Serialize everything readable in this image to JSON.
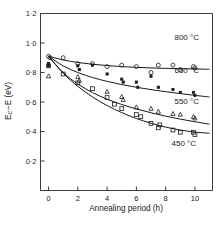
{
  "chart_data": {
    "type": "scatter",
    "title": "",
    "subtitle": "",
    "xlabel": "Annealing period (h)",
    "ylabel": "E_C − E (eV)",
    "ylabel_parts": {
      "main": "E",
      "sub": "C",
      "rest": "−E (eV)"
    },
    "xlim": [
      -0.55,
      11.2
    ],
    "ylim": [
      0.0,
      1.2
    ],
    "xticks": [
      0,
      2,
      4,
      6,
      8,
      10
    ],
    "xtick_labels": [
      "0",
      "2",
      "4",
      "6",
      "8",
      "10"
    ],
    "yticks": [
      0.2,
      0.4,
      0.6,
      0.8,
      1.0,
      1.2
    ],
    "ytick_labels": [
      "0·2",
      "0·4",
      "0·6",
      "0·8",
      "1·0",
      "1·2"
    ],
    "grid": false,
    "legend_position": "inline-right-of-curves",
    "series": [
      {
        "name": "800 °C",
        "label": "800 °C",
        "marker": "open-circle",
        "color": "#1a1a1a",
        "points": [
          [
            0.0,
            0.91
          ],
          [
            0.1,
            0.9
          ],
          [
            1.0,
            0.9
          ],
          [
            2.0,
            0.86
          ],
          [
            3.0,
            0.86
          ],
          [
            4.0,
            0.84
          ],
          [
            5.0,
            0.85
          ],
          [
            6.0,
            0.84
          ],
          [
            7.0,
            0.8
          ],
          [
            7.5,
            0.85
          ],
          [
            8.5,
            0.85
          ],
          [
            9.0,
            0.82
          ],
          [
            9.9,
            0.84
          ],
          [
            10.0,
            0.83
          ]
        ],
        "fit": [
          [
            0.0,
            0.91
          ],
          [
            1.0,
            0.885
          ],
          [
            2.0,
            0.868
          ],
          [
            3.0,
            0.856
          ],
          [
            4.0,
            0.847
          ],
          [
            5.0,
            0.84
          ],
          [
            6.0,
            0.835
          ],
          [
            7.0,
            0.831
          ],
          [
            8.0,
            0.828
          ],
          [
            9.0,
            0.826
          ],
          [
            10.0,
            0.824
          ],
          [
            11.0,
            0.822
          ]
        ],
        "label_x": 8.6,
        "label_y": 1.02
      },
      {
        "name": "650 °C",
        "label": "650 °C",
        "marker": "small-filled-square",
        "color": "#1a1a1a",
        "points": [
          [
            0.0,
            0.845
          ],
          [
            0.0,
            0.86
          ],
          [
            2.0,
            0.845
          ],
          [
            2.1,
            0.82
          ],
          [
            3.0,
            0.85
          ],
          [
            4.0,
            0.79
          ],
          [
            5.0,
            0.755
          ],
          [
            5.1,
            0.735
          ],
          [
            6.0,
            0.735
          ],
          [
            6.1,
            0.7
          ],
          [
            7.0,
            0.775
          ],
          [
            7.5,
            0.7
          ],
          [
            8.5,
            0.685
          ],
          [
            9.0,
            0.665
          ],
          [
            9.9,
            0.665
          ],
          [
            10.0,
            0.645
          ]
        ],
        "fit": [
          [
            0.0,
            0.91
          ],
          [
            1.0,
            0.845
          ],
          [
            2.0,
            0.8
          ],
          [
            3.0,
            0.766
          ],
          [
            4.0,
            0.74
          ],
          [
            5.0,
            0.718
          ],
          [
            6.0,
            0.7
          ],
          [
            7.0,
            0.684
          ],
          [
            8.0,
            0.67
          ],
          [
            9.0,
            0.657
          ],
          [
            10.0,
            0.645
          ],
          [
            11.0,
            0.634
          ]
        ],
        "label_x": 8.6,
        "label_y": 0.8
      },
      {
        "name": "550 °C",
        "label": "550 °C",
        "marker": "triangle",
        "color": "#1a1a1a",
        "points": [
          [
            0.0,
            0.775
          ],
          [
            2.0,
            0.77
          ],
          [
            2.1,
            0.745
          ],
          [
            4.0,
            0.67
          ],
          [
            5.0,
            0.635
          ],
          [
            5.1,
            0.615
          ],
          [
            6.0,
            0.565
          ],
          [
            7.0,
            0.555
          ],
          [
            7.5,
            0.535
          ],
          [
            8.5,
            0.52
          ],
          [
            9.0,
            0.515
          ],
          [
            9.9,
            0.5
          ],
          [
            10.0,
            0.49
          ]
        ],
        "fit": [
          [
            0.0,
            0.91
          ],
          [
            1.0,
            0.8
          ],
          [
            2.0,
            0.722
          ],
          [
            3.0,
            0.664
          ],
          [
            4.0,
            0.619
          ],
          [
            5.0,
            0.583
          ],
          [
            6.0,
            0.553
          ],
          [
            7.0,
            0.527
          ],
          [
            8.0,
            0.504
          ],
          [
            9.0,
            0.484
          ],
          [
            10.0,
            0.466
          ],
          [
            11.0,
            0.45
          ]
        ],
        "label_x": 8.6,
        "label_y": 0.585
      },
      {
        "name": "450 °C",
        "label": "450 °C",
        "marker": "open-square",
        "color": "#1a1a1a",
        "points": [
          [
            0.0,
            0.845
          ],
          [
            1.0,
            0.79
          ],
          [
            2.0,
            0.73
          ],
          [
            3.0,
            0.69
          ],
          [
            4.0,
            0.63
          ],
          [
            4.5,
            0.585
          ],
          [
            5.0,
            0.555
          ],
          [
            6.0,
            0.515
          ],
          [
            6.3,
            0.5
          ],
          [
            7.0,
            0.455
          ],
          [
            7.5,
            0.425
          ],
          [
            7.6,
            0.445
          ],
          [
            8.5,
            0.41
          ],
          [
            9.0,
            0.395
          ],
          [
            9.9,
            0.395
          ],
          [
            10.0,
            0.38
          ]
        ],
        "fit": [
          [
            0.0,
            0.91
          ],
          [
            1.0,
            0.795
          ],
          [
            2.0,
            0.706
          ],
          [
            3.0,
            0.634
          ],
          [
            4.0,
            0.576
          ],
          [
            5.0,
            0.528
          ],
          [
            6.0,
            0.488
          ],
          [
            7.0,
            0.456
          ],
          [
            8.0,
            0.43
          ],
          [
            9.0,
            0.41
          ],
          [
            10.0,
            0.396
          ],
          [
            11.0,
            0.388
          ]
        ],
        "label_x": 8.4,
        "label_y": 0.305
      }
    ]
  }
}
